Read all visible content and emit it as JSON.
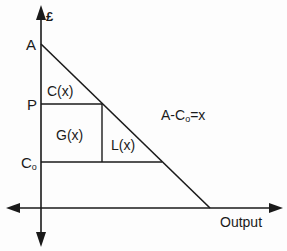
{
  "diagram": {
    "type": "economics-demand-surplus",
    "y_axis_label": "£",
    "x_axis_label": "Output",
    "points": {
      "A": "A",
      "P": "P",
      "C0_base": "C",
      "C0_sub": "o"
    },
    "regions": {
      "consumer": "C(x)",
      "gain": "G(x)",
      "loss": "L(x)"
    },
    "annotation": {
      "prefix": "A-C",
      "sub": "o",
      "suffix": "=x"
    },
    "colors": {
      "line": "#1a1a1a",
      "background": "#fdfdfd"
    }
  }
}
